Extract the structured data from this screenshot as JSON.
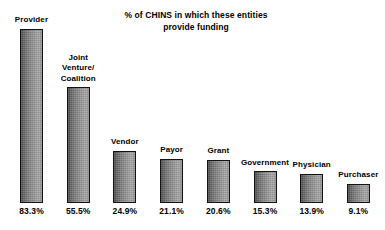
{
  "chart_data": {
    "type": "bar",
    "title": "% of CHINS in which these entities provide funding",
    "title_lines": [
      "% of CHINS in which these entities",
      "provide funding"
    ],
    "xlabel": "",
    "ylabel": "",
    "ylim": [
      0,
      100
    ],
    "grid": false,
    "legend": "none",
    "value_suffix": "%",
    "categories": [
      "Provider",
      "Joint Venture/ Coalition",
      "Vendor",
      "Payor",
      "Grant",
      "Government",
      "Physician",
      "Purchaser"
    ],
    "values": [
      83.3,
      55.5,
      24.9,
      21.1,
      20.6,
      15.3,
      13.9,
      9.1
    ],
    "value_labels": [
      "83.3%",
      "55.5%",
      "24.9%",
      "21.1%",
      "20.6%",
      "15.3%",
      "13.9%",
      "9.1%"
    ],
    "bars": [
      {
        "category": "Provider",
        "label_lines": [
          "Provider"
        ],
        "value": 83.3,
        "value_label": "83.3%"
      },
      {
        "category": "Joint Venture/ Coalition",
        "label_lines": [
          "Joint",
          "Venture/",
          "Coalition"
        ],
        "value": 55.5,
        "value_label": "55.5%"
      },
      {
        "category": "Vendor",
        "label_lines": [
          "Vendor"
        ],
        "value": 24.9,
        "value_label": "24.9%"
      },
      {
        "category": "Payor",
        "label_lines": [
          "Payor"
        ],
        "value": 21.1,
        "value_label": "21.1%"
      },
      {
        "category": "Grant",
        "label_lines": [
          "Grant"
        ],
        "value": 20.6,
        "value_label": "20.6%"
      },
      {
        "category": "Government",
        "label_lines": [
          "Government"
        ],
        "value": 15.3,
        "value_label": "15.3%"
      },
      {
        "category": "Physician",
        "label_lines": [
          "Physician"
        ],
        "value": 13.9,
        "value_label": "13.9%"
      },
      {
        "category": "Purchaser",
        "label_lines": [
          "Purchaser"
        ],
        "value": 9.1,
        "value_label": "9.1%"
      }
    ],
    "colors": {
      "background": "#ffffff",
      "text": "#000000",
      "bar_border": "#121212",
      "bar_fill_dark": "#4a4a4a",
      "bar_fill_light": "#a6a6a6"
    }
  }
}
